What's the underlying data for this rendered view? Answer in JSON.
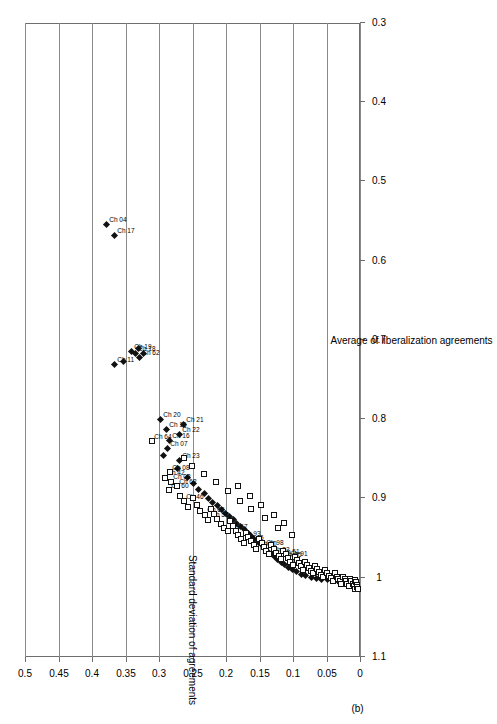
{
  "figure": {
    "panel_label": "(b)"
  },
  "chart_data": {
    "type": "scatter",
    "title": "",
    "xlabel": "Average of liberalization agreements",
    "ylabel": "Standard deviation of agreements",
    "xlim": [
      0.3,
      1.1
    ],
    "ylim": [
      0,
      0.5
    ],
    "xticks": [
      "0.3",
      "0.4",
      "0.5",
      "0.6",
      "0.7",
      "0.8",
      "0.9",
      "1",
      "1.1"
    ],
    "xtick_values": [
      0.3,
      0.4,
      0.5,
      0.6,
      0.7,
      0.8,
      0.9,
      1.0,
      1.1
    ],
    "yticks": [
      "0",
      "0.05",
      "0.1",
      "0.15",
      "0.2",
      "0.25",
      "0.3",
      "0.35",
      "0.4",
      "0.45",
      "0.5"
    ],
    "ytick_values": [
      0,
      0.05,
      0.1,
      0.15,
      0.2,
      0.25,
      0.3,
      0.35,
      0.4,
      0.45,
      0.5
    ],
    "grid": "vertical-only",
    "legend": "none",
    "orientation": "rotated-90",
    "series": [
      {
        "name": "filled-diamond",
        "marker": "diamond",
        "fill": "#111111",
        "points": [
          {
            "x": 0.554,
            "y": 0.378,
            "label": "Ch 04"
          },
          {
            "x": 0.568,
            "y": 0.365,
            "label": "Ch 17"
          },
          {
            "x": 0.73,
            "y": 0.365,
            "label": "Ch 11"
          },
          {
            "x": 0.726,
            "y": 0.352,
            "label": ""
          },
          {
            "x": 0.714,
            "y": 0.341,
            "label": "Ch 19"
          },
          {
            "x": 0.717,
            "y": 0.334,
            "label": "Ch 18"
          },
          {
            "x": 0.722,
            "y": 0.329,
            "label": "Ch 62"
          },
          {
            "x": 0.71,
            "y": 0.33,
            "label": ""
          },
          {
            "x": 0.716,
            "y": 0.322,
            "label": ""
          },
          {
            "x": 0.8,
            "y": 0.297,
            "label": "Ch 20"
          },
          {
            "x": 0.812,
            "y": 0.288,
            "label": "Ch 15"
          },
          {
            "x": 0.826,
            "y": 0.283,
            "label": "Ch 16"
          },
          {
            "x": 0.836,
            "y": 0.287,
            "label": "Ch 07"
          },
          {
            "x": 0.845,
            "y": 0.292,
            "label": ""
          },
          {
            "x": 0.806,
            "y": 0.262,
            "label": "Ch 21"
          },
          {
            "x": 0.818,
            "y": 0.268,
            "label": "Ch 22"
          },
          {
            "x": 0.852,
            "y": 0.268,
            "label": "Ch 23"
          },
          {
            "x": 0.862,
            "y": 0.272,
            "label": ""
          },
          {
            "x": 0.873,
            "y": 0.256,
            "label": ""
          },
          {
            "x": 0.88,
            "y": 0.248,
            "label": ""
          },
          {
            "x": 0.888,
            "y": 0.24,
            "label": ""
          },
          {
            "x": 0.893,
            "y": 0.232,
            "label": ""
          },
          {
            "x": 0.899,
            "y": 0.225,
            "label": ""
          },
          {
            "x": 0.904,
            "y": 0.219,
            "label": ""
          },
          {
            "x": 0.908,
            "y": 0.212,
            "label": ""
          },
          {
            "x": 0.913,
            "y": 0.206,
            "label": ""
          },
          {
            "x": 0.918,
            "y": 0.2,
            "label": ""
          },
          {
            "x": 0.922,
            "y": 0.194,
            "label": ""
          },
          {
            "x": 0.926,
            "y": 0.188,
            "label": ""
          },
          {
            "x": 0.931,
            "y": 0.183,
            "label": ""
          },
          {
            "x": 0.935,
            "y": 0.177,
            "label": ""
          },
          {
            "x": 0.939,
            "y": 0.171,
            "label": ""
          },
          {
            "x": 0.943,
            "y": 0.166,
            "label": ""
          },
          {
            "x": 0.947,
            "y": 0.161,
            "label": ""
          },
          {
            "x": 0.951,
            "y": 0.156,
            "label": ""
          },
          {
            "x": 0.955,
            "y": 0.151,
            "label": ""
          },
          {
            "x": 0.958,
            "y": 0.147,
            "label": ""
          },
          {
            "x": 0.962,
            "y": 0.142,
            "label": ""
          },
          {
            "x": 0.966,
            "y": 0.137,
            "label": ""
          },
          {
            "x": 0.969,
            "y": 0.132,
            "label": ""
          },
          {
            "x": 0.973,
            "y": 0.127,
            "label": ""
          },
          {
            "x": 0.976,
            "y": 0.122,
            "label": ""
          },
          {
            "x": 0.98,
            "y": 0.117,
            "label": ""
          },
          {
            "x": 0.983,
            "y": 0.112,
            "label": ""
          },
          {
            "x": 0.986,
            "y": 0.106,
            "label": ""
          },
          {
            "x": 0.989,
            "y": 0.1,
            "label": ""
          },
          {
            "x": 0.992,
            "y": 0.094,
            "label": ""
          },
          {
            "x": 0.995,
            "y": 0.087,
            "label": ""
          },
          {
            "x": 0.997,
            "y": 0.08,
            "label": ""
          },
          {
            "x": 0.999,
            "y": 0.072,
            "label": ""
          },
          {
            "x": 1.0,
            "y": 0.064,
            "label": ""
          },
          {
            "x": 1.001,
            "y": 0.056,
            "label": ""
          },
          {
            "x": 1.002,
            "y": 0.048,
            "label": ""
          },
          {
            "x": 1.003,
            "y": 0.04,
            "label": ""
          },
          {
            "x": 1.004,
            "y": 0.032,
            "label": ""
          },
          {
            "x": 1.005,
            "y": 0.025,
            "label": ""
          },
          {
            "x": 1.005,
            "y": 0.018,
            "label": ""
          },
          {
            "x": 1.006,
            "y": 0.012,
            "label": ""
          }
        ]
      },
      {
        "name": "open-square",
        "marker": "square",
        "fill": "#ffffff",
        "points": [
          {
            "x": 0.827,
            "y": 0.31,
            "label": "Ch 64"
          },
          {
            "x": 0.873,
            "y": 0.291,
            "label": "Ch 42"
          },
          {
            "x": 0.866,
            "y": 0.283,
            "label": "Ch 08"
          },
          {
            "x": 0.878,
            "y": 0.282,
            "label": "Ch 02"
          },
          {
            "x": 0.889,
            "y": 0.285,
            "label": "Ch 60"
          },
          {
            "x": 0.884,
            "y": 0.273,
            "label": "Ch 62"
          },
          {
            "x": 0.896,
            "y": 0.268,
            "label": ""
          },
          {
            "x": 0.903,
            "y": 0.262,
            "label": "Ch 46"
          },
          {
            "x": 0.91,
            "y": 0.256,
            "label": ""
          },
          {
            "x": 0.899,
            "y": 0.249,
            "label": ""
          },
          {
            "x": 0.908,
            "y": 0.243,
            "label": ""
          },
          {
            "x": 0.915,
            "y": 0.238,
            "label": ""
          },
          {
            "x": 0.92,
            "y": 0.231,
            "label": "Ch 65"
          },
          {
            "x": 0.926,
            "y": 0.226,
            "label": "Ch 57"
          },
          {
            "x": 0.912,
            "y": 0.222,
            "label": ""
          },
          {
            "x": 0.919,
            "y": 0.217,
            "label": ""
          },
          {
            "x": 0.925,
            "y": 0.212,
            "label": ""
          },
          {
            "x": 0.931,
            "y": 0.207,
            "label": ""
          },
          {
            "x": 0.936,
            "y": 0.202,
            "label": ""
          },
          {
            "x": 0.941,
            "y": 0.197,
            "label": "Ch 67"
          },
          {
            "x": 0.928,
            "y": 0.194,
            "label": ""
          },
          {
            "x": 0.934,
            "y": 0.189,
            "label": ""
          },
          {
            "x": 0.94,
            "y": 0.185,
            "label": ""
          },
          {
            "x": 0.945,
            "y": 0.181,
            "label": ""
          },
          {
            "x": 0.95,
            "y": 0.177,
            "label": "Ch 93"
          },
          {
            "x": 0.955,
            "y": 0.173,
            "label": "Ch 45"
          },
          {
            "x": 0.943,
            "y": 0.17,
            "label": ""
          },
          {
            "x": 0.948,
            "y": 0.166,
            "label": ""
          },
          {
            "x": 0.953,
            "y": 0.162,
            "label": ""
          },
          {
            "x": 0.958,
            "y": 0.158,
            "label": ""
          },
          {
            "x": 0.963,
            "y": 0.154,
            "label": "Ch 50"
          },
          {
            "x": 0.951,
            "y": 0.15,
            "label": ""
          },
          {
            "x": 0.956,
            "y": 0.146,
            "label": ""
          },
          {
            "x": 0.961,
            "y": 0.143,
            "label": "Ch 98"
          },
          {
            "x": 0.966,
            "y": 0.139,
            "label": ""
          },
          {
            "x": 0.97,
            "y": 0.135,
            "label": "Ch 82"
          },
          {
            "x": 0.958,
            "y": 0.132,
            "label": ""
          },
          {
            "x": 0.963,
            "y": 0.128,
            "label": ""
          },
          {
            "x": 0.968,
            "y": 0.124,
            "label": ""
          },
          {
            "x": 0.972,
            "y": 0.12,
            "label": "Ch 51"
          },
          {
            "x": 0.976,
            "y": 0.117,
            "label": "Ch 45"
          },
          {
            "x": 0.966,
            "y": 0.114,
            "label": ""
          },
          {
            "x": 0.97,
            "y": 0.11,
            "label": ""
          },
          {
            "x": 0.975,
            "y": 0.107,
            "label": "Ch 91"
          },
          {
            "x": 0.979,
            "y": 0.103,
            "label": ""
          },
          {
            "x": 0.983,
            "y": 0.1,
            "label": ""
          },
          {
            "x": 0.973,
            "y": 0.097,
            "label": ""
          },
          {
            "x": 0.977,
            "y": 0.093,
            "label": ""
          },
          {
            "x": 0.981,
            "y": 0.09,
            "label": ""
          },
          {
            "x": 0.985,
            "y": 0.087,
            "label": ""
          },
          {
            "x": 0.989,
            "y": 0.084,
            "label": ""
          },
          {
            "x": 0.979,
            "y": 0.081,
            "label": ""
          },
          {
            "x": 0.983,
            "y": 0.078,
            "label": ""
          },
          {
            "x": 0.987,
            "y": 0.075,
            "label": ""
          },
          {
            "x": 0.991,
            "y": 0.072,
            "label": ""
          },
          {
            "x": 0.994,
            "y": 0.069,
            "label": ""
          },
          {
            "x": 0.984,
            "y": 0.066,
            "label": ""
          },
          {
            "x": 0.988,
            "y": 0.063,
            "label": ""
          },
          {
            "x": 0.992,
            "y": 0.06,
            "label": ""
          },
          {
            "x": 0.996,
            "y": 0.057,
            "label": ""
          },
          {
            "x": 0.999,
            "y": 0.054,
            "label": ""
          },
          {
            "x": 0.989,
            "y": 0.051,
            "label": ""
          },
          {
            "x": 0.993,
            "y": 0.048,
            "label": ""
          },
          {
            "x": 0.997,
            "y": 0.045,
            "label": ""
          },
          {
            "x": 1.0,
            "y": 0.042,
            "label": ""
          },
          {
            "x": 1.003,
            "y": 0.04,
            "label": ""
          },
          {
            "x": 0.994,
            "y": 0.037,
            "label": ""
          },
          {
            "x": 0.998,
            "y": 0.034,
            "label": ""
          },
          {
            "x": 1.001,
            "y": 0.032,
            "label": ""
          },
          {
            "x": 1.004,
            "y": 0.029,
            "label": ""
          },
          {
            "x": 1.007,
            "y": 0.027,
            "label": ""
          },
          {
            "x": 0.998,
            "y": 0.024,
            "label": ""
          },
          {
            "x": 1.001,
            "y": 0.022,
            "label": ""
          },
          {
            "x": 1.004,
            "y": 0.02,
            "label": ""
          },
          {
            "x": 1.007,
            "y": 0.018,
            "label": ""
          },
          {
            "x": 1.01,
            "y": 0.016,
            "label": ""
          },
          {
            "x": 1.001,
            "y": 0.014,
            "label": ""
          },
          {
            "x": 1.004,
            "y": 0.012,
            "label": ""
          },
          {
            "x": 1.007,
            "y": 0.01,
            "label": ""
          },
          {
            "x": 1.01,
            "y": 0.008,
            "label": ""
          },
          {
            "x": 1.013,
            "y": 0.007,
            "label": ""
          },
          {
            "x": 1.002,
            "y": 0.006,
            "label": ""
          },
          {
            "x": 1.005,
            "y": 0.005,
            "label": ""
          },
          {
            "x": 1.008,
            "y": 0.004,
            "label": ""
          },
          {
            "x": 1.011,
            "y": 0.003,
            "label": ""
          },
          {
            "x": 1.014,
            "y": 0.002,
            "label": ""
          },
          {
            "x": 0.946,
            "y": 0.101,
            "label": ""
          },
          {
            "x": 0.936,
            "y": 0.121,
            "label": ""
          },
          {
            "x": 0.924,
            "y": 0.141,
            "label": ""
          },
          {
            "x": 0.912,
            "y": 0.162,
            "label": ""
          },
          {
            "x": 0.902,
            "y": 0.178,
            "label": ""
          },
          {
            "x": 0.89,
            "y": 0.196,
            "label": ""
          },
          {
            "x": 0.878,
            "y": 0.214,
            "label": ""
          },
          {
            "x": 0.869,
            "y": 0.232,
            "label": ""
          },
          {
            "x": 0.858,
            "y": 0.25,
            "label": ""
          },
          {
            "x": 0.848,
            "y": 0.262,
            "label": ""
          },
          {
            "x": 0.93,
            "y": 0.112,
            "label": ""
          },
          {
            "x": 0.92,
            "y": 0.128,
            "label": ""
          },
          {
            "x": 0.908,
            "y": 0.147,
            "label": ""
          },
          {
            "x": 0.896,
            "y": 0.163,
            "label": ""
          },
          {
            "x": 0.884,
            "y": 0.182,
            "label": ""
          }
        ]
      }
    ]
  }
}
